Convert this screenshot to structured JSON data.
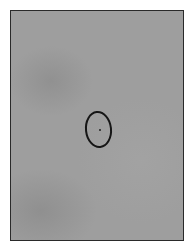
{
  "image": {
    "description": "Grayscale photograph of a gray paper surface with a hand-drawn dark oval and a small dot at its center, inside a thin dark frame",
    "colors": {
      "background": "#ffffff",
      "paper": "#9e9e9e",
      "frame": "#2a2a2a",
      "ink": "#161616"
    },
    "elements": [
      {
        "type": "frame",
        "label": "photo-frame"
      },
      {
        "type": "drawn-oval",
        "label": "hand-drawn oval"
      },
      {
        "type": "dot",
        "label": "center dot"
      }
    ]
  }
}
